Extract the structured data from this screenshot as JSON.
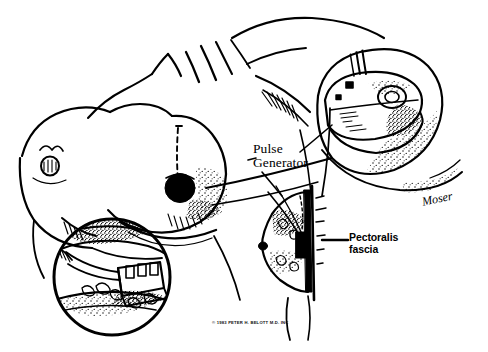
{
  "figure": {
    "style": "pen-and-ink medical line illustration",
    "background_color": "#ffffff",
    "ink_color": "#000000"
  },
  "labels": {
    "pulse_generator": "Pulse\nGenerator",
    "pectoralis_fascia": "Pectoralis\nfascia",
    "signature": "Moser",
    "copyright": "© 1983 PETER H. BELOTT M.D. INC"
  },
  "views": {
    "main": {
      "name": "anterior-torso-view",
      "description": "Female chest and torso, oblique anterior view with both breasts, clavicle, shoulder and axilla; dashed incision line over the left chest and a solid marked nipple"
    },
    "inset_top_right": {
      "name": "pulse-generator-pocket-detail",
      "description": "Circular inset showing the pulse generator can with lead wires seated in the subcutaneous pocket"
    },
    "inset_bottom_left": {
      "name": "surgical-pocket-detail",
      "description": "Circular inset showing the opened submammary pocket with the device and leads during implantation"
    },
    "cross_section": {
      "name": "lateral-cross-section",
      "description": "Lateral sagittal cross-section of the breast and chest wall showing the device plane relative to the pectoralis fascia"
    }
  }
}
